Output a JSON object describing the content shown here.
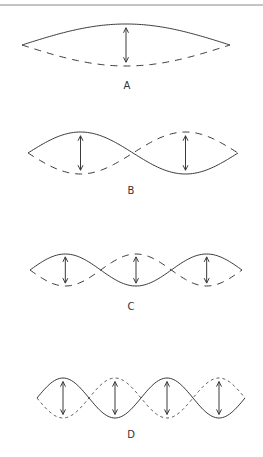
{
  "figure": {
    "colors": {
      "line": "#3a3a3a",
      "rule": "#8a8a8a",
      "background": "#ffffff"
    },
    "panels": [
      {
        "id": "A",
        "label": "A",
        "loops": 1,
        "dash_style": "long",
        "arrows": 1
      },
      {
        "id": "B",
        "label": "B",
        "loops": 2,
        "dash_style": "long",
        "arrows": 2
      },
      {
        "id": "C",
        "label": "C",
        "loops": 3,
        "dash_style": "medium",
        "arrows": 3
      },
      {
        "id": "D",
        "label": "D",
        "loops": 4,
        "dash_style": "short",
        "arrows": 4
      }
    ]
  }
}
